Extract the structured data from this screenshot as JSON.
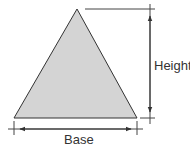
{
  "diagram": {
    "shape": "triangle",
    "labels": {
      "height": "Height",
      "base": "Base"
    },
    "colors": {
      "fill": "#d4d4d4",
      "stroke": "#333333",
      "background": "#ffffff"
    },
    "geometry": {
      "apex": [
        77,
        9
      ],
      "base_left": [
        14,
        118
      ],
      "base_right": [
        137,
        118
      ]
    }
  }
}
